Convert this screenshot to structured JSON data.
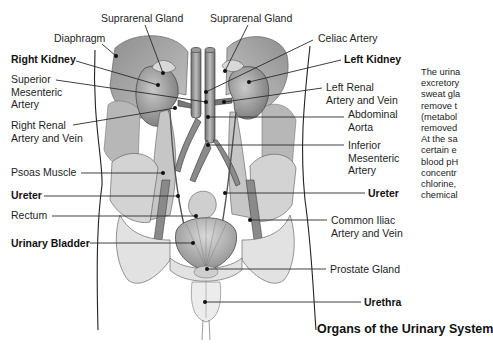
{
  "figure": {
    "caption": "Organs of the Urinary System",
    "colors": {
      "leader": "#2a2a2a",
      "tissue_dark": "#7a7a7a",
      "tissue_mid": "#a9a9a9",
      "tissue_light": "#d6d6d6",
      "bone": "#e4e4e4",
      "background": "#ffffff"
    }
  },
  "labels": [
    {
      "id": "suprarenal-gland-right",
      "text": [
        "Suprarenal Gland"
      ],
      "bold": false,
      "x": 101,
      "y": 12,
      "dot": [
        163,
        73
      ],
      "from": [
        145,
        25
      ]
    },
    {
      "id": "suprarenal-gland-left",
      "text": [
        "Suprarenal Gland"
      ],
      "bold": false,
      "x": 210,
      "y": 12,
      "dot": [
        225,
        71
      ],
      "from": [
        248,
        25
      ]
    },
    {
      "id": "diaphragm",
      "text": [
        "Diaphragm"
      ],
      "bold": false,
      "x": 54,
      "y": 32,
      "dot": [
        116,
        56
      ],
      "from": [
        102,
        44
      ]
    },
    {
      "id": "celiac-artery",
      "text": [
        "Celiac Artery"
      ],
      "bold": false,
      "x": 318,
      "y": 32,
      "dot": [
        206,
        92
      ],
      "from": [
        313,
        40
      ]
    },
    {
      "id": "right-kidney",
      "text": [
        "Right Kidney"
      ],
      "bold": true,
      "x": 11,
      "y": 53,
      "dot": [
        158,
        85
      ],
      "from": [
        76,
        61
      ]
    },
    {
      "id": "left-kidney",
      "text": [
        "Left Kidney"
      ],
      "bold": true,
      "x": 344,
      "y": 53,
      "dot": [
        249,
        82
      ],
      "from": [
        341,
        60
      ]
    },
    {
      "id": "superior-mesenteric-artery",
      "text": [
        "Superior",
        "Mesenteric",
        "Artery"
      ],
      "bold": false,
      "x": 11,
      "y": 73,
      "dot": [
        206,
        102
      ],
      "from": [
        56,
        80
      ]
    },
    {
      "id": "left-renal-artery-vein",
      "text": [
        "Left Renal",
        "Artery and Vein"
      ],
      "bold": false,
      "x": 326,
      "y": 81,
      "dot": [
        224,
        102
      ],
      "from": [
        322,
        88
      ]
    },
    {
      "id": "right-renal-artery-vein",
      "text": [
        "Right Renal",
        "Artery and Vein"
      ],
      "bold": false,
      "x": 11,
      "y": 119,
      "dot": [
        175,
        108
      ],
      "from": [
        73,
        125
      ]
    },
    {
      "id": "abdominal-aorta",
      "text": [
        "Abdominal",
        "Aorta"
      ],
      "bold": false,
      "x": 348,
      "y": 108,
      "dot": [
        208,
        117
      ],
      "from": [
        344,
        117
      ]
    },
    {
      "id": "inferior-mesenteric-artery",
      "text": [
        "Inferior",
        "Mesenteric",
        "Artery"
      ],
      "bold": false,
      "x": 348,
      "y": 139,
      "dot": [
        208,
        145
      ],
      "from": [
        344,
        145
      ]
    },
    {
      "id": "psoas-muscle",
      "text": [
        "Psoas Muscle"
      ],
      "bold": false,
      "x": 11,
      "y": 166,
      "dot": [
        163,
        173
      ],
      "from": [
        81,
        173
      ]
    },
    {
      "id": "ureter-right",
      "text": [
        "Ureter"
      ],
      "bold": true,
      "x": 11,
      "y": 189,
      "dot": [
        178,
        196
      ],
      "from": [
        44,
        196
      ]
    },
    {
      "id": "ureter-left",
      "text": [
        "Ureter"
      ],
      "bold": true,
      "x": 368,
      "y": 187,
      "dot": [
        225,
        193
      ],
      "from": [
        365,
        193
      ]
    },
    {
      "id": "rectum",
      "text": [
        "Rectum"
      ],
      "bold": false,
      "x": 11,
      "y": 209,
      "dot": [
        196,
        216
      ],
      "from": [
        52,
        216
      ]
    },
    {
      "id": "common-iliac-artery-vein",
      "text": [
        "Common Iliac",
        "Artery and Vein"
      ],
      "bold": false,
      "x": 331,
      "y": 214,
      "dot": [
        250,
        220
      ],
      "from": [
        327,
        220
      ]
    },
    {
      "id": "urinary-bladder",
      "text": [
        "Urinary Bladder"
      ],
      "bold": true,
      "x": 11,
      "y": 237,
      "dot": [
        193,
        243
      ],
      "from": [
        90,
        243
      ]
    },
    {
      "id": "prostate-gland",
      "text": [
        "Prostate Gland"
      ],
      "bold": false,
      "x": 330,
      "y": 263,
      "dot": [
        207,
        269
      ],
      "from": [
        326,
        269
      ]
    },
    {
      "id": "urethra",
      "text": [
        "Urethra"
      ],
      "bold": true,
      "x": 364,
      "y": 296,
      "dot": [
        205,
        302
      ],
      "from": [
        361,
        302
      ]
    }
  ],
  "sidebar_text": {
    "lines": [
      "The urina",
      "excretory",
      "sweat gla",
      "remove t",
      "(metabol",
      "removed",
      "At the sa",
      "certain e",
      "blood pH",
      "concentr",
      "chlorine,",
      "chemical"
    ]
  }
}
